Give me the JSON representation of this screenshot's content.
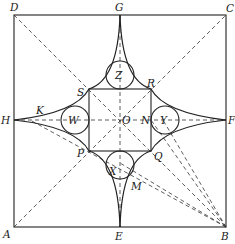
{
  "diagram": {
    "type": "geometric-construction",
    "colors": {
      "ink": "#222222",
      "background": "#ffffff"
    },
    "outer_square": {
      "corners": [
        "A",
        "B",
        "C",
        "D"
      ]
    },
    "inner_square": {
      "corners": [
        "P",
        "Q",
        "R",
        "S"
      ]
    },
    "center": "O",
    "circles": [
      "Z",
      "W",
      "Y",
      "X"
    ],
    "labels": {
      "A": "A",
      "B": "B",
      "C": "C",
      "D": "D",
      "E": "E",
      "F": "F",
      "G": "G",
      "H": "H",
      "K": "K",
      "M": "M",
      "N": "N",
      "O": "O",
      "P": "P",
      "Q": "Q",
      "R": "R",
      "S": "S",
      "W": "W",
      "X": "X",
      "Y": "Y",
      "Z": "Z"
    }
  }
}
